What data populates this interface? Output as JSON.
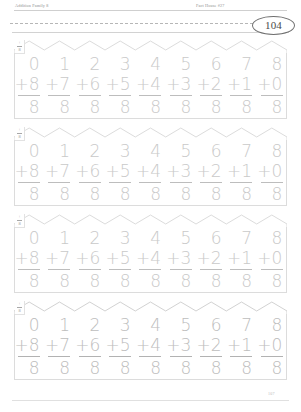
{
  "header": {
    "left_label": "Addition Family 8",
    "right_label": "Fact House #27"
  },
  "page_number": "104",
  "footer": {
    "page_number": "107"
  },
  "corner_marker": {
    "operator": "+",
    "addend": "8"
  },
  "rows": [
    {
      "id": "fact-house-row-1",
      "problems": [
        {
          "top": "0",
          "add": "+8",
          "answer": "8"
        },
        {
          "top": "1",
          "add": "+7",
          "answer": "8"
        },
        {
          "top": "2",
          "add": "+6",
          "answer": "8"
        },
        {
          "top": "3",
          "add": "+5",
          "answer": "8"
        },
        {
          "top": "4",
          "add": "+4",
          "answer": "8"
        },
        {
          "top": "5",
          "add": "+3",
          "answer": "8"
        },
        {
          "top": "6",
          "add": "+2",
          "answer": "8"
        },
        {
          "top": "7",
          "add": "+1",
          "answer": "8"
        },
        {
          "top": "8",
          "add": "+0",
          "answer": "8"
        }
      ]
    },
    {
      "id": "fact-house-row-2",
      "problems": [
        {
          "top": "0",
          "add": "+8",
          "answer": "8"
        },
        {
          "top": "1",
          "add": "+7",
          "answer": "8"
        },
        {
          "top": "2",
          "add": "+6",
          "answer": "8"
        },
        {
          "top": "3",
          "add": "+5",
          "answer": "8"
        },
        {
          "top": "4",
          "add": "+4",
          "answer": "8"
        },
        {
          "top": "5",
          "add": "+3",
          "answer": "8"
        },
        {
          "top": "6",
          "add": "+2",
          "answer": "8"
        },
        {
          "top": "7",
          "add": "+1",
          "answer": "8"
        },
        {
          "top": "8",
          "add": "+0",
          "answer": "8"
        }
      ]
    },
    {
      "id": "fact-house-row-3",
      "problems": [
        {
          "top": "0",
          "add": "+8",
          "answer": "8"
        },
        {
          "top": "1",
          "add": "+7",
          "answer": "8"
        },
        {
          "top": "2",
          "add": "+6",
          "answer": "8"
        },
        {
          "top": "3",
          "add": "+5",
          "answer": "8"
        },
        {
          "top": "4",
          "add": "+4",
          "answer": "8"
        },
        {
          "top": "5",
          "add": "+3",
          "answer": "8"
        },
        {
          "top": "6",
          "add": "+2",
          "answer": "8"
        },
        {
          "top": "7",
          "add": "+1",
          "answer": "8"
        },
        {
          "top": "8",
          "add": "+0",
          "answer": "8"
        }
      ]
    },
    {
      "id": "fact-house-row-4",
      "problems": [
        {
          "top": "0",
          "add": "+8",
          "answer": "8"
        },
        {
          "top": "1",
          "add": "+7",
          "answer": "8"
        },
        {
          "top": "2",
          "add": "+6",
          "answer": "8"
        },
        {
          "top": "3",
          "add": "+5",
          "answer": "8"
        },
        {
          "top": "4",
          "add": "+4",
          "answer": "8"
        },
        {
          "top": "5",
          "add": "+3",
          "answer": "8"
        },
        {
          "top": "6",
          "add": "+2",
          "answer": "8"
        },
        {
          "top": "7",
          "add": "+1",
          "answer": "8"
        },
        {
          "top": "8",
          "add": "+0",
          "answer": "8"
        }
      ]
    }
  ],
  "colors": {
    "trace_gray": "#c9c9c9",
    "rule_gray": "#dcdcdc",
    "ink_gray": "#8d8d8d"
  }
}
